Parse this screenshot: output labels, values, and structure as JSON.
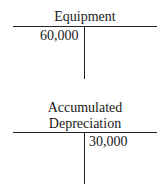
{
  "accounts": [
    {
      "title_lines": [
        "Equipment"
      ],
      "debit": "60,000",
      "credit": ""
    },
    {
      "title_lines": [
        "Accumulated",
        "Depreciation"
      ],
      "debit": "",
      "credit": "30,000"
    }
  ]
}
